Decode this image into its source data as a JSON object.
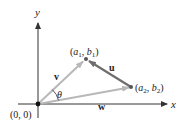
{
  "diagram": {
    "colors": {
      "axis": "#333333",
      "vector_light": "#b8b8b8",
      "vector_dark": "#6e6e6e",
      "text": "#222222",
      "point": "#555555"
    },
    "axes": {
      "x_label": "x",
      "y_label": "y",
      "origin_label": "(0, 0)"
    },
    "points": {
      "p1": {
        "label_a": "a",
        "label_a_sub": "1",
        "label_b": "b",
        "label_b_sub": "1"
      },
      "p2": {
        "label_a": "a",
        "label_a_sub": "2",
        "label_b": "b",
        "label_b_sub": "2"
      }
    },
    "vectors": {
      "u": {
        "label": "u",
        "from": "(a2, b2)",
        "to": "(a1, b1)"
      },
      "v": {
        "label": "v",
        "from": "(0, 0)",
        "to": "(a1, b1)"
      },
      "w": {
        "label": "w",
        "from": "(0, 0)",
        "to": "(a2, b2)"
      }
    },
    "angle": {
      "label": "θ",
      "between": [
        "v",
        "w"
      ]
    }
  }
}
